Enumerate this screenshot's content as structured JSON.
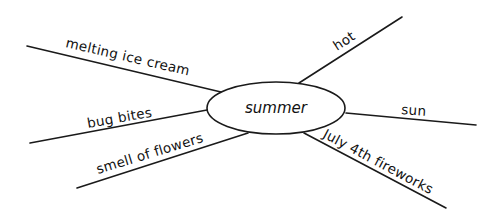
{
  "diagram": {
    "type": "spider-map",
    "center": {
      "label": "summer",
      "cx": 276,
      "cy": 108,
      "rx": 69,
      "ry": 26
    },
    "spokes": [
      {
        "id": "melting-ice-cream",
        "label": "melting ice cream",
        "line": {
          "x1": 27,
          "y1": 46,
          "x2": 221,
          "y2": 92
        },
        "text": {
          "x": 65,
          "y": 47,
          "angle": 13
        }
      },
      {
        "id": "hot",
        "label": "hot",
        "line": {
          "x1": 402,
          "y1": 17,
          "x2": 299,
          "y2": 83
        },
        "text": {
          "x": 337,
          "y": 51,
          "angle": -33
        }
      },
      {
        "id": "sun",
        "label": "sun",
        "line": {
          "x1": 346,
          "y1": 113,
          "x2": 476,
          "y2": 125
        },
        "text": {
          "x": 401,
          "y": 114,
          "angle": 4
        }
      },
      {
        "id": "july-4th-fireworks",
        "label": "July 4th fireworks",
        "line": {
          "x1": 304,
          "y1": 133,
          "x2": 446,
          "y2": 208
        },
        "text": {
          "x": 322,
          "y": 137,
          "angle": 28
        }
      },
      {
        "id": "bug-bites",
        "label": "bug bites",
        "line": {
          "x1": 30,
          "y1": 143,
          "x2": 207,
          "y2": 110
        },
        "text": {
          "x": 88,
          "y": 128,
          "angle": -10
        }
      },
      {
        "id": "smell-of-flowers",
        "label": "smell of flowers",
        "line": {
          "x1": 77,
          "y1": 188,
          "x2": 248,
          "y2": 133
        },
        "text": {
          "x": 98,
          "y": 174,
          "angle": -17
        }
      }
    ],
    "colors": {
      "stroke": "#1a1a1a",
      "text": "#111111",
      "background": "#ffffff"
    }
  }
}
